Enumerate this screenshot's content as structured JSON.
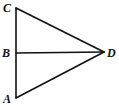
{
  "diagram": {
    "type": "geometry",
    "points": [
      {
        "id": "C",
        "label": "C"
      },
      {
        "id": "B",
        "label": "B"
      },
      {
        "id": "A",
        "label": "A"
      },
      {
        "id": "D",
        "label": "D"
      }
    ],
    "segments": [
      {
        "from": "C",
        "to": "A"
      },
      {
        "from": "C",
        "to": "D"
      },
      {
        "from": "A",
        "to": "D"
      },
      {
        "from": "B",
        "to": "D"
      }
    ],
    "colors": {
      "stroke": "#111111",
      "background": "#ffffff"
    }
  }
}
